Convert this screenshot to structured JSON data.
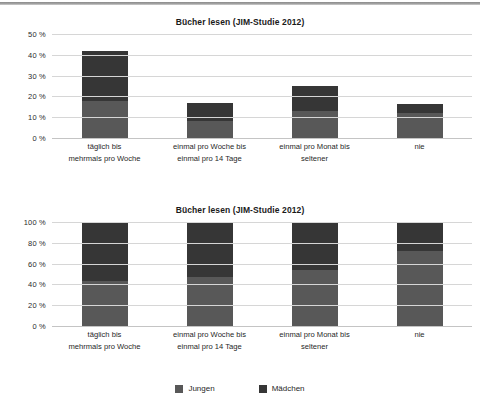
{
  "legend": {
    "position": "bottom-center",
    "entries": [
      {
        "label": "Jungen",
        "color": "#585858"
      },
      {
        "label": "Mädchen",
        "color": "#363636"
      }
    ]
  },
  "chart_data": [
    {
      "id": "absolute",
      "type": "bar",
      "stacked": true,
      "title": "Bücher lesen (JIM-Studie 2012)",
      "xlabel": "",
      "ylabel": "",
      "ylim": [
        0,
        50
      ],
      "grid": true,
      "yticks": [
        "0 %",
        "10 %",
        "20 %",
        "30 %",
        "40 %",
        "50 %"
      ],
      "ytick_values": [
        0,
        10,
        20,
        30,
        40,
        50
      ],
      "categories": [
        "täglich bis\nmehrmals pro Woche",
        "einmal pro Woche bis\neinmal pro 14 Tage",
        "einmal pro Monat bis\nseltener",
        "nie"
      ],
      "category_lines": [
        [
          "täglich bis",
          "mehrmals pro Woche"
        ],
        [
          "einmal pro Woche bis",
          "einmal pro 14 Tage"
        ],
        [
          "einmal pro Monat bis",
          "seltener"
        ],
        [
          "nie",
          ""
        ]
      ],
      "series": [
        {
          "name": "Jungen",
          "color": "#585858",
          "values": [
            18,
            8,
            13,
            12
          ]
        },
        {
          "name": "Mädchen",
          "color": "#363636",
          "values": [
            24,
            9,
            12,
            4.5
          ]
        }
      ],
      "totals": [
        42,
        17,
        25,
        16.5
      ]
    },
    {
      "id": "relative",
      "type": "bar",
      "stacked": true,
      "stack_normalized": true,
      "title": "Bücher lesen (JIM-Studie 2012)",
      "xlabel": "",
      "ylabel": "",
      "ylim": [
        0,
        100
      ],
      "grid": true,
      "yticks": [
        "0 %",
        "20 %",
        "40 %",
        "60 %",
        "80 %",
        "100 %"
      ],
      "ytick_values": [
        0,
        20,
        40,
        60,
        80,
        100
      ],
      "categories": [
        "täglich bis\nmehrmals pro Woche",
        "einmal pro Woche bis\neinmal pro 14 Tage",
        "einmal pro Monat bis\nseltener",
        "nie"
      ],
      "category_lines": [
        [
          "täglich bis",
          "mehrmals pro Woche"
        ],
        [
          "einmal pro Woche bis",
          "einmal pro 14 Tage"
        ],
        [
          "einmal pro Monat bis",
          "seltener"
        ],
        [
          "nie",
          ""
        ]
      ],
      "series": [
        {
          "name": "Jungen",
          "color": "#585858",
          "values": [
            43,
            47,
            54,
            72
          ]
        },
        {
          "name": "Mädchen",
          "color": "#363636",
          "values": [
            57,
            53,
            46,
            28
          ]
        }
      ],
      "totals": [
        100,
        100,
        100,
        100
      ]
    }
  ]
}
